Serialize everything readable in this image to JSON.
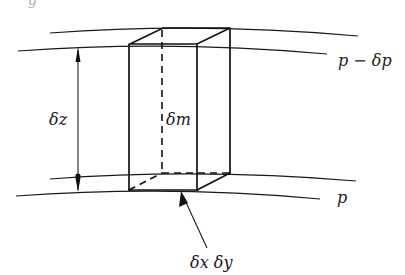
{
  "figure": {
    "caption_fragment": "g",
    "surfaces": {
      "upper": {
        "label": "p − δp"
      },
      "lower": {
        "label": "p"
      }
    },
    "labels": {
      "height": "δz",
      "mass": "δm",
      "area": "δx δy"
    },
    "colors": {
      "ink": "#111111",
      "background": "#ffffff"
    }
  }
}
